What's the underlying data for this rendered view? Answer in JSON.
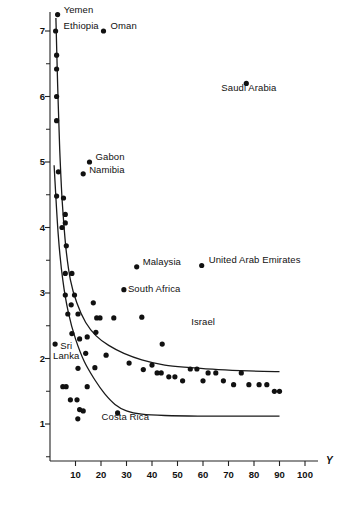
{
  "chart_data": {
    "type": "scatter",
    "title": "",
    "xlabel": "Y",
    "ylabel": "",
    "xlim": [
      0,
      104
    ],
    "ylim": [
      0.5,
      7.4
    ],
    "grid": false,
    "legend": "none",
    "x_ticks": [
      10,
      20,
      30,
      40,
      50,
      60,
      70,
      80,
      90,
      100
    ],
    "x_tick_labels": [
      "10",
      "20",
      "30",
      "40",
      "50",
      "60",
      "70",
      "80",
      "90",
      "100"
    ],
    "y_ticks": [
      1,
      2,
      3,
      4,
      5,
      6,
      7
    ],
    "y_tick_labels": [
      "1",
      "2",
      "3",
      "4",
      "5",
      "6",
      "7"
    ],
    "y_minor_ticks": [
      0.5,
      1.5,
      2.5,
      3.5,
      4.5,
      5.5,
      6.5
    ],
    "marker": "filled-circle",
    "marker_color": "#111111",
    "labeled_points": [
      {
        "label": "Yemen",
        "x": 3.0,
        "y": 7.25,
        "label_dx": 6,
        "label_dy": -5
      },
      {
        "label": "Ethiopia",
        "x": 2.2,
        "y": 7.0,
        "label_dx": 8,
        "label_dy": -5
      },
      {
        "label": "Oman",
        "x": 21.0,
        "y": 7.0,
        "label_dx": 7,
        "label_dy": -5
      },
      {
        "label": "Saudi Arabia",
        "x": 77.0,
        "y": 6.2,
        "label_dx": -25,
        "label_dy": 5
      },
      {
        "label": "Gabon",
        "x": 15.5,
        "y": 5.0,
        "label_dx": 6,
        "label_dy": -5
      },
      {
        "label": "Namibia",
        "x": 13.0,
        "y": 4.82,
        "label_dx": 6,
        "label_dy": -4
      },
      {
        "label": "Malaysia",
        "x": 34.0,
        "y": 3.4,
        "label_dx": 6,
        "label_dy": -5
      },
      {
        "label": "United Arab Emirates",
        "x": 59.5,
        "y": 3.42,
        "label_dx": 7,
        "label_dy": -5
      },
      {
        "label": "South Africa",
        "x": 29.0,
        "y": 3.05,
        "label_dx": 4,
        "label_dy": -1
      },
      {
        "label": "Israel",
        "x": 53.0,
        "y": 2.5,
        "label_dx": 6,
        "label_dy": -4
      },
      {
        "label": "Sri\nLanka",
        "x": 2.0,
        "y": 2.22,
        "label_dx": -2,
        "label_dy": 2
      },
      {
        "label": "Costa Rica",
        "x": 26.5,
        "y": 1.17,
        "label_dx": -16,
        "label_dy": 4
      }
    ],
    "points": [
      [
        3.0,
        7.25
      ],
      [
        2.2,
        7.0
      ],
      [
        21.0,
        7.0
      ],
      [
        77.0,
        6.2
      ],
      [
        2.6,
        6.63
      ],
      [
        2.6,
        6.42
      ],
      [
        2.6,
        6.0
      ],
      [
        2.6,
        5.63
      ],
      [
        3.3,
        4.85
      ],
      [
        15.5,
        5.0
      ],
      [
        13.0,
        4.82
      ],
      [
        2.6,
        4.48
      ],
      [
        5.3,
        4.45
      ],
      [
        6.0,
        4.2
      ],
      [
        6.0,
        4.07
      ],
      [
        4.7,
        4.0
      ],
      [
        6.4,
        3.72
      ],
      [
        6.0,
        3.3
      ],
      [
        8.6,
        3.3
      ],
      [
        34.0,
        3.4
      ],
      [
        59.5,
        3.42
      ],
      [
        29.0,
        3.05
      ],
      [
        6.0,
        2.97
      ],
      [
        9.6,
        2.97
      ],
      [
        8.3,
        2.82
      ],
      [
        17.0,
        2.85
      ],
      [
        7.0,
        2.68
      ],
      [
        11.0,
        2.68
      ],
      [
        18.3,
        2.62
      ],
      [
        19.6,
        2.62
      ],
      [
        25.0,
        2.62
      ],
      [
        36.0,
        2.63
      ],
      [
        8.6,
        2.38
      ],
      [
        11.6,
        2.3
      ],
      [
        14.6,
        2.33
      ],
      [
        18.0,
        2.4
      ],
      [
        2.0,
        2.22
      ],
      [
        14.0,
        2.08
      ],
      [
        22.0,
        2.05
      ],
      [
        44.0,
        2.22
      ],
      [
        11.0,
        1.85
      ],
      [
        17.6,
        1.86
      ],
      [
        5.0,
        1.57
      ],
      [
        6.3,
        1.57
      ],
      [
        14.6,
        1.57
      ],
      [
        49.0,
        1.72
      ],
      [
        8.0,
        1.37
      ],
      [
        10.6,
        1.37
      ],
      [
        11.6,
        1.22
      ],
      [
        13.0,
        1.2
      ],
      [
        10.9,
        1.08
      ],
      [
        26.5,
        1.17
      ],
      [
        31.0,
        1.93
      ],
      [
        36.6,
        1.83
      ],
      [
        40.0,
        1.9
      ],
      [
        42.0,
        1.78
      ],
      [
        43.6,
        1.78
      ],
      [
        46.6,
        1.72
      ],
      [
        52.0,
        1.66
      ],
      [
        55.0,
        1.84
      ],
      [
        57.6,
        1.84
      ],
      [
        62.0,
        1.78
      ],
      [
        65.0,
        1.78
      ],
      [
        60.0,
        1.66
      ],
      [
        68.0,
        1.66
      ],
      [
        72.0,
        1.6
      ],
      [
        75.0,
        1.78
      ],
      [
        78.0,
        1.6
      ],
      [
        82.0,
        1.6
      ],
      [
        85.0,
        1.6
      ],
      [
        88.0,
        1.5
      ],
      [
        90.0,
        1.5
      ]
    ],
    "curves": [
      {
        "name": "upper-envelope",
        "points": [
          [
            2.3,
            7.2
          ],
          [
            3.0,
            6.2
          ],
          [
            3.8,
            5.2
          ],
          [
            4.8,
            4.4
          ],
          [
            6.2,
            3.7
          ],
          [
            8.0,
            3.2
          ],
          [
            10.5,
            2.85
          ],
          [
            14.0,
            2.55
          ],
          [
            18.0,
            2.35
          ],
          [
            23.0,
            2.2
          ],
          [
            29.0,
            2.08
          ],
          [
            36.0,
            1.98
          ],
          [
            45.0,
            1.9
          ],
          [
            55.0,
            1.86
          ],
          [
            66.0,
            1.83
          ],
          [
            78.0,
            1.81
          ],
          [
            90.0,
            1.8
          ]
        ]
      },
      {
        "name": "lower-envelope",
        "points": [
          [
            1.6,
            4.95
          ],
          [
            3.2,
            3.9
          ],
          [
            5.0,
            3.2
          ],
          [
            7.2,
            2.7
          ],
          [
            10.0,
            2.3
          ],
          [
            13.5,
            1.95
          ],
          [
            17.5,
            1.68
          ],
          [
            21.5,
            1.46
          ],
          [
            25.5,
            1.3
          ],
          [
            30.0,
            1.2
          ],
          [
            36.0,
            1.15
          ],
          [
            45.0,
            1.13
          ],
          [
            58.0,
            1.12
          ],
          [
            72.0,
            1.12
          ],
          [
            90.0,
            1.12
          ]
        ]
      }
    ]
  },
  "axes": {
    "x_axis_name": "Y"
  }
}
